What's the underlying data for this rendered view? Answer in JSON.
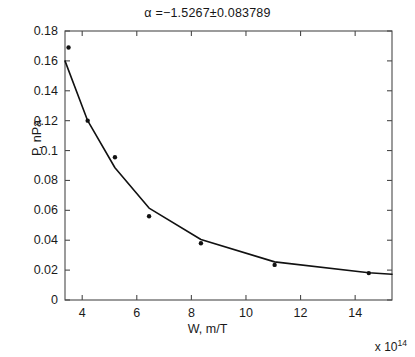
{
  "chart_data": {
    "type": "scatter",
    "title": "α =−1.5267±0.083789",
    "xlabel": "W, m/T",
    "ylabel": "P, nPa",
    "x_exponent_prefix": "x 10",
    "x_exponent_power": "14",
    "xlim": [
      3.37,
      15.35
    ],
    "ylim": [
      0,
      0.18
    ],
    "grid": false,
    "legend": null,
    "xticks": [
      "4",
      "6",
      "8",
      "10",
      "12",
      "14"
    ],
    "xtick_values": [
      4,
      6,
      8,
      10,
      12,
      14
    ],
    "yticks": [
      "0",
      "0.02",
      "0.04",
      "0.06",
      "0.08",
      "0.1",
      "0.12",
      "0.14",
      "0.16",
      "0.18"
    ],
    "ytick_values": [
      0,
      0.02,
      0.04,
      0.06,
      0.08,
      0.1,
      0.12,
      0.14,
      0.16,
      0.18
    ],
    "series": [
      {
        "name": "measured-points",
        "kind": "scatter",
        "marker": "dot",
        "color": "#111111",
        "x": [
          3.5,
          4.2,
          5.2,
          6.45,
          8.35,
          11.05,
          14.5
        ],
        "y": [
          0.169,
          0.12,
          0.0955,
          0.056,
          0.038,
          0.0235,
          0.018
        ]
      },
      {
        "name": "power-law-fit",
        "kind": "line",
        "color": "#111111",
        "x": [
          3.37,
          4.2,
          5.2,
          6.45,
          8.35,
          11.05,
          14.5,
          15.35
        ],
        "y": [
          0.16,
          0.12,
          0.0885,
          0.0615,
          0.0405,
          0.0255,
          0.0182,
          0.0172
        ]
      }
    ],
    "annotations": {
      "alpha_symbol": "α",
      "alpha_value": "-1.5267",
      "alpha_uncertainty": "0.083789"
    }
  },
  "figure": {
    "axes_box": {
      "left": 65,
      "top": 31,
      "right": 392,
      "bottom": 300
    },
    "axis_color": "#4a4a4a",
    "data_color": "#111111",
    "background": "#ffffff"
  }
}
